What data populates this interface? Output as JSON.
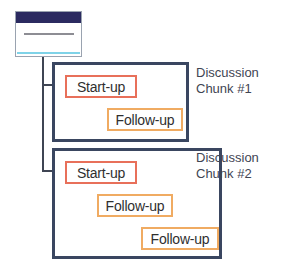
{
  "diagram": {
    "source_icon": {
      "name": "document-window-icon",
      "titlebar_color": "#2b2a60",
      "accent_color": "#7fd3e8",
      "border_color": "#9aa3b0"
    },
    "colors": {
      "chunk_border": "#3a4660",
      "startup_border": "#e8705a",
      "followup_border": "#f0ab62",
      "connector": "#3f4553",
      "text": "#2f2f2f",
      "caption_text": "#3f4553",
      "background": "#ffffff"
    },
    "chunks": [
      {
        "caption_line1": "Discussion",
        "caption_line2": "Chunk #1",
        "nodes": [
          {
            "label": "Start-up",
            "type": "startup"
          },
          {
            "label": "Follow-up",
            "type": "followup"
          }
        ]
      },
      {
        "caption_line1": "Discussion",
        "caption_line2": "Chunk #2",
        "nodes": [
          {
            "label": "Start-up",
            "type": "startup"
          },
          {
            "label": "Follow-up",
            "type": "followup"
          },
          {
            "label": "Follow-up",
            "type": "followup"
          }
        ]
      }
    ]
  }
}
